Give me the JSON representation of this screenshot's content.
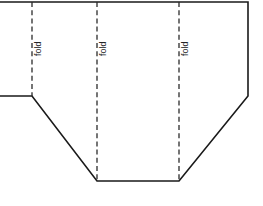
{
  "figure": {
    "background_color": "#ffffff",
    "outline_color": "#1a1a1a",
    "fold_line_color": "#2b2b2b",
    "label_color": "#252525",
    "width": 263,
    "height": 206
  },
  "outline": {
    "name": "pattern-outline",
    "points": "0,2 248,2 248,96 179,181 97,181 32,96 0,96",
    "description": "pattern piece outline with angled lower corners"
  },
  "fold_lines": [
    {
      "name": "fold-line-1",
      "label": "fold",
      "x": 32,
      "y_top": 2,
      "y_bottom": 96,
      "label_x": 41,
      "label_y": 56
    },
    {
      "name": "fold-line-2",
      "label": "fold",
      "x": 97,
      "y_top": 2,
      "y_bottom": 181,
      "label_x": 106,
      "label_y": 56
    },
    {
      "name": "fold-line-3",
      "label": "fold",
      "x": 179,
      "y_top": 2,
      "y_bottom": 181,
      "label_x": 188,
      "label_y": 56
    }
  ]
}
